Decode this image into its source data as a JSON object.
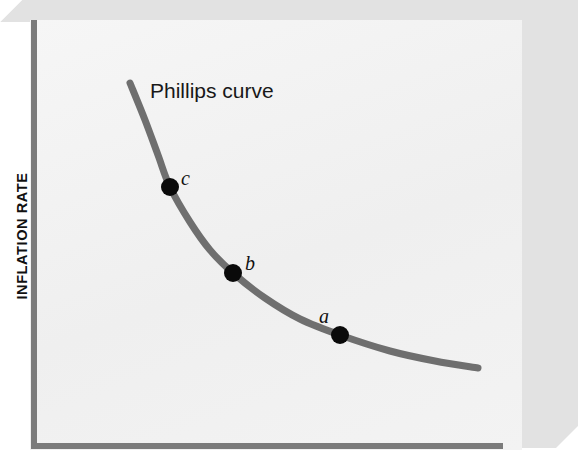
{
  "figure": {
    "width": 578,
    "height": 461,
    "background": "#ffffff",
    "panel_color": "#f2f2f2",
    "block_face_color": "#e2e2e2",
    "axis_color": "#7b7b7b"
  },
  "axes": {
    "ylabel": "INFLATION RATE",
    "xlabel": ""
  },
  "annotations": {
    "curve_title": "Phillips curve",
    "point_a": "a",
    "point_b": "b",
    "point_c": "c"
  },
  "chart_data": {
    "type": "line",
    "title": "",
    "xlabel": "",
    "ylabel": "INFLATION RATE",
    "grid": false,
    "legend": null,
    "axis_ticks": {
      "x": [],
      "y": []
    },
    "series": [
      {
        "name": "Phillips curve",
        "color": "#6f6f6f",
        "line_width": 7,
        "description": "Downward-sloping convex curve: high inflation at low unemployment, falling and flattening as unemployment rises.",
        "points": [
          {
            "x": 130,
            "y": 83
          },
          {
            "x": 145,
            "y": 120
          },
          {
            "x": 158,
            "y": 155
          },
          {
            "x": 170,
            "y": 187
          },
          {
            "x": 190,
            "y": 222
          },
          {
            "x": 210,
            "y": 250
          },
          {
            "x": 233,
            "y": 273
          },
          {
            "x": 265,
            "y": 298
          },
          {
            "x": 300,
            "y": 319
          },
          {
            "x": 340,
            "y": 335
          },
          {
            "x": 390,
            "y": 351
          },
          {
            "x": 435,
            "y": 361
          },
          {
            "x": 478,
            "y": 368
          }
        ]
      }
    ],
    "markers": [
      {
        "label": "c",
        "x": 170,
        "y": 187,
        "radius": 9,
        "color": "#0a0a0a"
      },
      {
        "label": "b",
        "x": 233,
        "y": 273,
        "radius": 9,
        "color": "#0a0a0a"
      },
      {
        "label": "a",
        "x": 340,
        "y": 335,
        "radius": 9,
        "color": "#0a0a0a"
      }
    ],
    "annotations": [
      {
        "text": "Phillips curve",
        "x": 150,
        "y": 79
      }
    ]
  }
}
